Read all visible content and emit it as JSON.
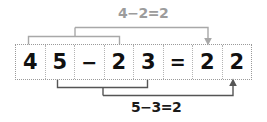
{
  "diagram": {
    "equation": {
      "cells": [
        {
          "name": "minuend-tens",
          "text": "4",
          "kind": "digit"
        },
        {
          "name": "minuend-units",
          "text": "5",
          "kind": "digit"
        },
        {
          "name": "minus-sign",
          "text": "−",
          "kind": "operator"
        },
        {
          "name": "subtrahend-tens",
          "text": "2",
          "kind": "digit"
        },
        {
          "name": "subtrahend-units",
          "text": "3",
          "kind": "digit"
        },
        {
          "name": "equals-sign",
          "text": "=",
          "kind": "operator"
        },
        {
          "name": "result-tens",
          "text": "2",
          "kind": "digit"
        },
        {
          "name": "result-units",
          "text": "2",
          "kind": "digit"
        }
      ]
    },
    "annotations": [
      {
        "name": "tens-column-annotation",
        "label": "4−2=2",
        "color": "#9c9c9c",
        "position": "above",
        "sources": [
          "minuend-tens",
          "subtrahend-tens"
        ],
        "target": "result-tens"
      },
      {
        "name": "units-column-annotation",
        "label": "5−3=2",
        "color": "#1a1a1a",
        "position": "below",
        "sources": [
          "minuend-units",
          "subtrahend-units"
        ],
        "target": "result-units"
      }
    ],
    "colors": {
      "cell_border": "#b4b4b4",
      "strip_border": "#9a9a9a",
      "digit": "#111111",
      "top_bracket": "#a8a8a8",
      "bottom_bracket": "#555555",
      "background": "#ffffff"
    }
  }
}
